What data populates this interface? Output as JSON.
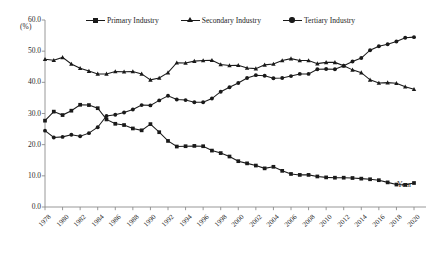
{
  "chart_data": {
    "type": "line",
    "title": "",
    "xlabel": "Year",
    "ylabel": "(%)",
    "ylim": [
      0.0,
      60.0
    ],
    "yticks": [
      "0.0",
      "10.0",
      "20.0",
      "30.0",
      "40.0",
      "50.0",
      "60.0"
    ],
    "grid": false,
    "legend_position": "top-center",
    "x": [
      1978,
      1979,
      1980,
      1981,
      1982,
      1983,
      1984,
      1985,
      1986,
      1987,
      1988,
      1989,
      1990,
      1991,
      1992,
      1993,
      1994,
      1995,
      1996,
      1997,
      1998,
      1999,
      2000,
      2001,
      2002,
      2003,
      2004,
      2005,
      2006,
      2007,
      2008,
      2009,
      2010,
      2011,
      2012,
      2013,
      2014,
      2015,
      2016,
      2017,
      2018,
      2019,
      2020
    ],
    "xticks": [
      "1978",
      "1980",
      "1982",
      "1984",
      "1986",
      "1988",
      "1990",
      "1992",
      "1994",
      "1996",
      "1998",
      "2000",
      "2002",
      "2004",
      "2006",
      "2008",
      "2010",
      "2012",
      "2014",
      "2016",
      "2018",
      "2020"
    ],
    "series": [
      {
        "name": "Primary Industry",
        "marker": "square",
        "color": "#1a1a1a",
        "values": [
          27.7,
          30.6,
          29.5,
          30.9,
          32.8,
          32.7,
          31.7,
          28.1,
          26.7,
          26.3,
          25.2,
          24.6,
          26.6,
          24.0,
          21.2,
          19.4,
          19.5,
          19.6,
          19.5,
          18.1,
          17.3,
          16.2,
          14.7,
          14.0,
          13.3,
          12.4,
          12.9,
          11.6,
          10.6,
          10.3,
          10.3,
          9.8,
          9.5,
          9.4,
          9.4,
          9.3,
          9.1,
          8.9,
          8.6,
          7.9,
          7.2,
          7.1,
          7.7
        ]
      },
      {
        "name": "Secondary Industry",
        "marker": "triangle",
        "color": "#1a1a1a",
        "values": [
          47.4,
          47.1,
          48.0,
          45.9,
          44.5,
          43.6,
          42.7,
          42.7,
          43.5,
          43.4,
          43.5,
          42.7,
          40.8,
          41.4,
          43.1,
          46.3,
          46.2,
          46.8,
          47.0,
          47.1,
          45.7,
          45.4,
          45.5,
          44.6,
          44.4,
          45.6,
          45.9,
          47.0,
          47.6,
          47.0,
          47.0,
          46.0,
          46.4,
          46.4,
          45.3,
          44.0,
          43.1,
          40.8,
          39.8,
          39.9,
          39.7,
          38.6,
          37.8
        ]
      },
      {
        "name": "Tertiary Industry",
        "marker": "circle",
        "color": "#1a1a1a",
        "values": [
          24.5,
          22.3,
          22.5,
          23.2,
          22.7,
          23.7,
          25.6,
          29.2,
          29.6,
          30.3,
          31.3,
          32.7,
          32.6,
          34.2,
          35.7,
          34.5,
          34.3,
          33.6,
          33.6,
          34.8,
          37.0,
          38.4,
          39.8,
          41.4,
          42.3,
          42.1,
          41.3,
          41.4,
          42.0,
          42.7,
          42.7,
          44.2,
          44.3,
          44.2,
          45.3,
          46.7,
          47.8,
          50.3,
          51.6,
          52.2,
          53.1,
          54.3,
          54.5
        ]
      }
    ]
  },
  "legend": {
    "items": [
      {
        "label": "Primary Industry",
        "marker": "square"
      },
      {
        "label": "Secondary Industry",
        "marker": "triangle"
      },
      {
        "label": "Tertiary Industry",
        "marker": "circle"
      }
    ]
  },
  "axis": {
    "unit_label": "(%)",
    "x_axis_title": "Year"
  }
}
